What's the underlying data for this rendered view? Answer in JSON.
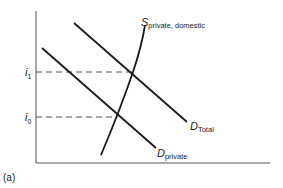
{
  "figure": {
    "panel_label": "(a)",
    "y_axis_ticks": [
      {
        "main": "i",
        "sub": "1",
        "y": 72
      },
      {
        "main": "i",
        "sub": "0",
        "y": 117
      }
    ],
    "curves": {
      "supply": {
        "main": "S",
        "sub": "private, domestic"
      },
      "demand_total": {
        "main": "D",
        "sub": "Total"
      },
      "demand_private": {
        "main": "D",
        "sub": "private"
      }
    },
    "colors": {
      "line": "#1a1a1a",
      "dash": "#555555",
      "axis": "#444444"
    }
  }
}
